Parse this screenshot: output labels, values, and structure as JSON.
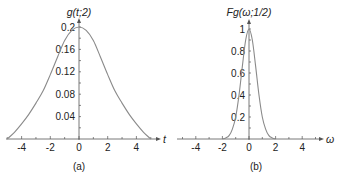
{
  "chart_data": [
    {
      "id": "a",
      "type": "line",
      "title": "",
      "caption": "(a)",
      "ylabel": "g(t;2)",
      "xlabel": "t",
      "xlim": [
        -5.2,
        5.2
      ],
      "ylim": [
        0,
        0.205
      ],
      "x_ticks": [
        -4,
        -2,
        0,
        2,
        4
      ],
      "x_tick_labels": [
        "-4",
        "-2",
        "0",
        "2",
        "4"
      ],
      "y_ticks": [
        0.04,
        0.08,
        0.12,
        0.16,
        0.2
      ],
      "y_tick_labels": [
        "0.04",
        "0.08",
        "0.12",
        "0.16",
        "0.2"
      ],
      "grid": false,
      "legend": null,
      "series": [
        {
          "name": "g(t;2)",
          "color": "#8a8a8a",
          "x": [
            -5,
            -4.5,
            -4,
            -3.5,
            -3,
            -2.5,
            -2,
            -1.5,
            -1,
            -0.5,
            0,
            0.5,
            1,
            1.5,
            2,
            2.5,
            3,
            3.5,
            4,
            4.5,
            5
          ],
          "values": [
            0.0,
            0.012,
            0.027,
            0.044,
            0.064,
            0.086,
            0.115,
            0.146,
            0.176,
            0.194,
            0.2,
            0.194,
            0.176,
            0.146,
            0.115,
            0.086,
            0.064,
            0.044,
            0.027,
            0.012,
            0.0
          ]
        }
      ]
    },
    {
      "id": "b",
      "type": "line",
      "title": "",
      "caption": "(b)",
      "ylabel": "Fg(ω;1/2)",
      "xlabel": "ω",
      "xlim": [
        -5.2,
        5.2
      ],
      "ylim": [
        0,
        1.02
      ],
      "x_ticks": [
        -4,
        -2,
        0,
        2,
        4
      ],
      "x_tick_labels": [
        "-4",
        "-2",
        "0",
        "2",
        "4"
      ],
      "y_ticks": [
        0.2,
        0.4,
        0.6,
        0.8,
        1
      ],
      "y_tick_labels": [
        "0.2",
        "0.4",
        "0.6",
        "0.8",
        "1"
      ],
      "grid": false,
      "legend": null,
      "series": [
        {
          "name": "Fg(ω;1/2)",
          "color": "#8a8a8a",
          "x": [
            -2,
            -1.75,
            -1.5,
            -1.25,
            -1,
            -0.75,
            -0.5,
            -0.25,
            0,
            0.25,
            0.5,
            0.75,
            1,
            1.25,
            1.5,
            1.75,
            2
          ],
          "values": [
            0.0,
            0.01,
            0.03,
            0.09,
            0.2,
            0.4,
            0.66,
            0.9,
            1.0,
            0.9,
            0.66,
            0.4,
            0.2,
            0.09,
            0.03,
            0.01,
            0.0
          ]
        }
      ]
    }
  ],
  "panels": {
    "a": {
      "ylabel": "g(t;2)",
      "xlabel": "t",
      "caption": "(a)"
    },
    "b": {
      "ylabel": "Fg(ω;1/2)",
      "xlabel": "ω",
      "caption": "(b)"
    }
  }
}
